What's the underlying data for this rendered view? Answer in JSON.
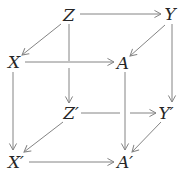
{
  "diagram": {
    "kind": "commutative-cube-diagram",
    "canvas": {
      "width": 188,
      "height": 179
    },
    "colors": {
      "background": "#ffffff",
      "line": "#848484",
      "label": "#262626"
    },
    "nodes": [
      {
        "id": "Z",
        "label": "Z",
        "x": 69,
        "y": 15
      },
      {
        "id": "Y",
        "label": "Y",
        "x": 170,
        "y": 14
      },
      {
        "id": "X",
        "label": "X",
        "x": 14,
        "y": 62
      },
      {
        "id": "A",
        "label": "A",
        "x": 123,
        "y": 63
      },
      {
        "id": "Z-prime",
        "label": "Z′",
        "x": 71,
        "y": 113
      },
      {
        "id": "Y-prime",
        "label": "Y′",
        "x": 166,
        "y": 113
      },
      {
        "id": "X-prime",
        "label": "X′",
        "x": 16,
        "y": 162
      },
      {
        "id": "A-prime",
        "label": "A′",
        "x": 125,
        "y": 162
      }
    ],
    "edges": [
      {
        "id": "Z-to-Y",
        "from": "Z",
        "to": "Y",
        "segments": [
          [
            80,
            14,
            161,
            14
          ]
        ]
      },
      {
        "id": "Z-to-X",
        "from": "Z",
        "to": "X",
        "segments": [
          [
            61,
            24,
            22,
            55
          ]
        ]
      },
      {
        "id": "Y-to-A",
        "from": "Y",
        "to": "A",
        "segments": [
          [
            165,
            25,
            130,
            56
          ]
        ]
      },
      {
        "id": "X-to-A",
        "from": "X",
        "to": "A",
        "segments": [
          [
            25,
            62,
            114,
            62
          ]
        ]
      },
      {
        "id": "Z-to-Z-prime",
        "from": "Z",
        "to": "Z′",
        "segments": [
          [
            69,
            24,
            69,
            61
          ],
          [
            69,
            68,
            69,
            103
          ]
        ]
      },
      {
        "id": "Y-to-Y-prime",
        "from": "Y",
        "to": "Y′",
        "segments": [
          [
            172,
            24,
            172,
            102
          ]
        ]
      },
      {
        "id": "X-to-X-prime",
        "from": "X",
        "to": "X′",
        "segments": [
          [
            13,
            72,
            13,
            150
          ]
        ]
      },
      {
        "id": "A-to-A-prime",
        "from": "A",
        "to": "A′",
        "segments": [
          [
            125,
            72,
            125,
            150
          ]
        ]
      },
      {
        "id": "Z-prime-to-Y-prime",
        "from": "Z′",
        "to": "Y′",
        "segments": [
          [
            81,
            113,
            120,
            113
          ],
          [
            130,
            113,
            156,
            113
          ]
        ]
      },
      {
        "id": "Z-prime-to-X-prime",
        "from": "Z′",
        "to": "X′",
        "segments": [
          [
            63,
            122,
            24,
            152
          ]
        ]
      },
      {
        "id": "Y-prime-to-A-prime",
        "from": "Y′",
        "to": "A′",
        "segments": [
          [
            161,
            122,
            132,
            152
          ]
        ]
      },
      {
        "id": "X-prime-to-A-prime",
        "from": "X′",
        "to": "A′",
        "segments": [
          [
            29,
            162,
            114,
            162
          ]
        ]
      }
    ]
  }
}
